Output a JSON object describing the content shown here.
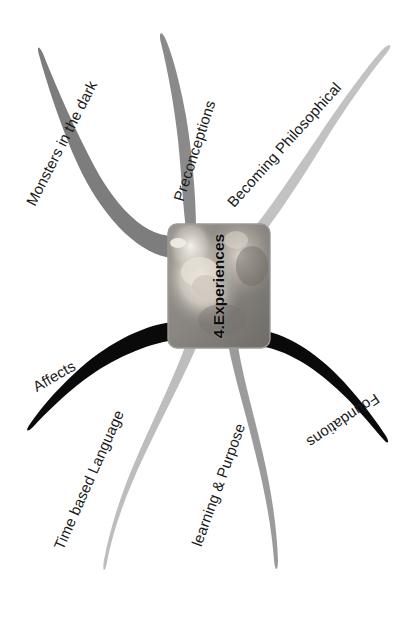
{
  "diagram": {
    "type": "mind-map",
    "title": "4.Experiences",
    "center": {
      "label": "4.Experiences",
      "image_alt": "photo-of-children-looking-at-object",
      "border_color": "#9a9a9a",
      "background_color": "#8e8e8e"
    },
    "background_color": "#ffffff",
    "label_color": "#1a1a1a",
    "branches": [
      {
        "id": "monsters-in-the-dark",
        "label": "Monsters in the dark",
        "color": "#7d7d7d",
        "direction": "upper-left",
        "label_rotation": -63,
        "label_x": 30,
        "label_y": 196,
        "font_size": 15
      },
      {
        "id": "preconceptions",
        "label": "Preconceptions",
        "color": "#8a8a8a",
        "direction": "up",
        "label_rotation": -72,
        "label_x": 178,
        "label_y": 192,
        "font_size": 15
      },
      {
        "id": "becoming-philosophical",
        "label": "Becoming Philosophical",
        "color": "#c2c2c2",
        "direction": "upper-right",
        "label_rotation": -48,
        "label_x": 230,
        "label_y": 196,
        "font_size": 15
      },
      {
        "id": "affects",
        "label": "Affects",
        "color": "#0a0a0a",
        "direction": "left",
        "label_rotation": -30,
        "label_x": 34,
        "label_y": 379,
        "font_size": 15
      },
      {
        "id": "time-based-language",
        "label": "Time based Language",
        "color": "#bdbdbd",
        "direction": "lower-left",
        "label_rotation": -66,
        "label_x": 58,
        "label_y": 540,
        "font_size": 15
      },
      {
        "id": "learning-and-purpose",
        "label": "learning & Purpose",
        "color": "#9b9b9b",
        "direction": "lower-right",
        "label_rotation": -70,
        "label_x": 196,
        "label_y": 537,
        "font_size": 15
      },
      {
        "id": "foundations",
        "label": "Foundations",
        "color": "#0a0a0a",
        "direction": "right",
        "label_rotation": -214,
        "label_x": 378,
        "label_y": 389,
        "font_size": 15
      }
    ]
  }
}
